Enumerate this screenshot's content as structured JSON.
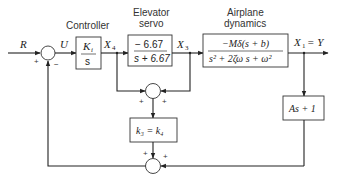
{
  "diagram": {
    "type": "block-diagram",
    "signals": {
      "input": "R",
      "error": "U",
      "controller_out": "X",
      "controller_out_sub": "4",
      "servo_out": "X",
      "servo_out_sub": "3",
      "output": "X",
      "output_sub": "1",
      "output_eq": " = Y"
    },
    "blocks": {
      "controller": {
        "title": "Controller",
        "num": "K",
        "num_sub": "i",
        "den": "s"
      },
      "elevator_servo": {
        "title_line1": "Elevator",
        "title_line2": "servo",
        "num": "− 6.67",
        "den": "s + 6.67"
      },
      "airplane_dynamics": {
        "title_line1": "Airplane",
        "title_line2": "dynamics",
        "num": "−Mδ(s + b)",
        "den": "s² + 2ζω s + ω²"
      },
      "gain_k3": {
        "text": "k₃ = k₄"
      },
      "sensor": {
        "text": "As + 1"
      }
    },
    "summing_junctions": {
      "main": {
        "plus": "+",
        "minus": "−"
      },
      "inner": {
        "left": "+",
        "right": "+"
      },
      "lower": {
        "left": "+",
        "right": "+"
      }
    }
  }
}
